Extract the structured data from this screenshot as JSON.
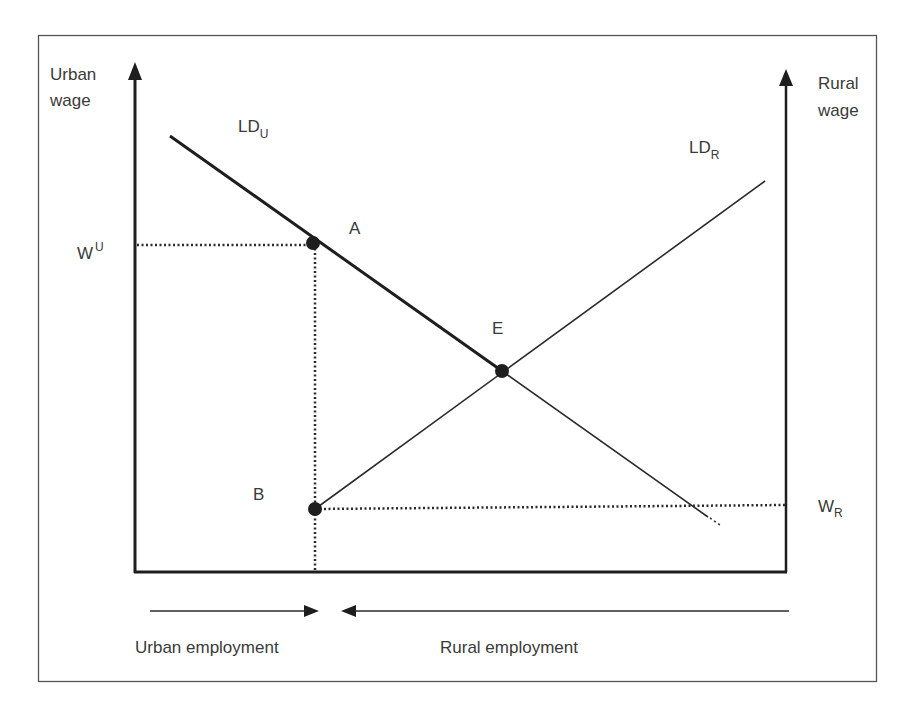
{
  "diagram": {
    "type": "economics-labor-market",
    "axes": {
      "left": {
        "label_line1": "Urban",
        "label_line2": "wage"
      },
      "right": {
        "label_line1": "Rural",
        "label_line2": "wage"
      }
    },
    "curves": {
      "ld_urban": {
        "main": "LD",
        "sub": "U"
      },
      "ld_rural": {
        "main": "LD",
        "sub": "R"
      }
    },
    "points": {
      "a": {
        "label": "A"
      },
      "b": {
        "label": "B"
      },
      "e": {
        "label": "E"
      }
    },
    "wages": {
      "urban": {
        "main": "W",
        "sup": "U"
      },
      "rural": {
        "main": "W",
        "sub": "R"
      }
    },
    "employment": {
      "urban": "Urban employment",
      "rural": "Rural employment"
    },
    "colors": {
      "stroke": "#2b2b2b",
      "text": "#3a3a3a",
      "frame": "#555555"
    }
  }
}
